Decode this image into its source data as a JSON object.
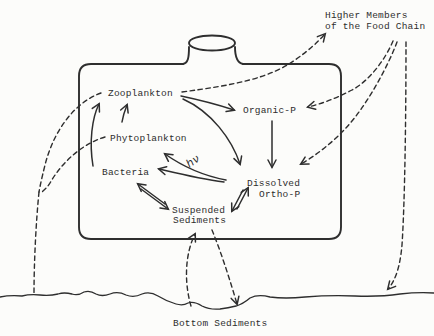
{
  "colors": {
    "ink": "#2e2e2e",
    "paper": "#fcfcfa"
  },
  "nodes": {
    "higher_members": {
      "line1": "Higher Members",
      "line2": "of the Food Chain"
    },
    "zooplankton": {
      "label": "Zooplankton"
    },
    "organic_p": {
      "label": "Organic-P"
    },
    "phytoplankton": {
      "label": "Phytoplankton"
    },
    "bacteria": {
      "label": "Bacteria"
    },
    "light": {
      "label": "hν"
    },
    "dissolved_ortho_p": {
      "line1": "Dissolved",
      "line2": "Ortho-P"
    },
    "suspended_sediments": {
      "line1": "Suspended",
      "line2": "Sediments"
    },
    "bottom_sediments": {
      "label": "Bottom Sediments"
    }
  }
}
